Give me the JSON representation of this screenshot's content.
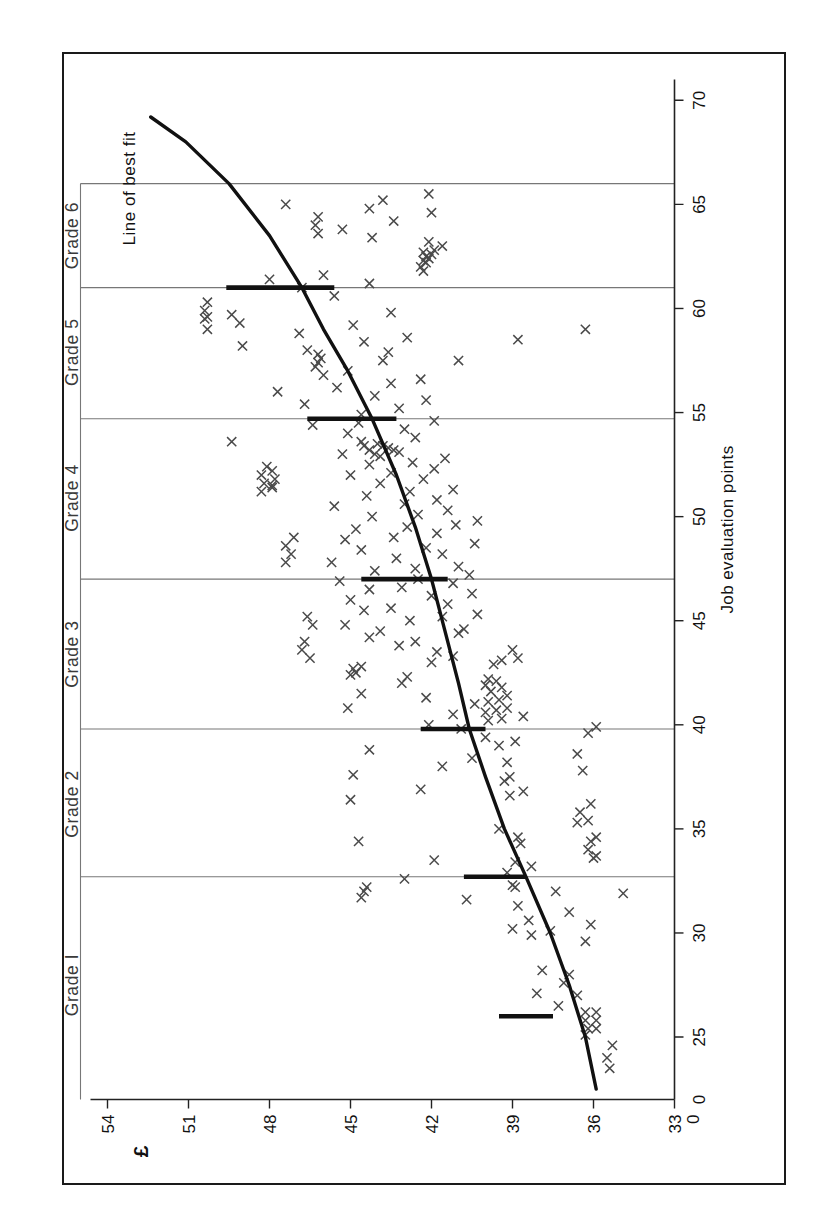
{
  "chart_data": {
    "type": "scatter",
    "title": "",
    "xlabel": "Job evaluation points",
    "ylabel": "£",
    "xlim": [
      22,
      71
    ],
    "ylim": [
      33,
      55
    ],
    "x_ticks": [
      0,
      25,
      30,
      35,
      40,
      45,
      50,
      55,
      60,
      65,
      70
    ],
    "x_tick_labels": [
      "0",
      "25",
      "30",
      "35",
      "40",
      "45",
      "50",
      "55",
      "60",
      "65",
      "70"
    ],
    "y_ticks": [
      33,
      36,
      39,
      42,
      45,
      48,
      51,
      54
    ],
    "y_tick_labels": [
      "33",
      "36",
      "39",
      "42",
      "45",
      "48",
      "51",
      "54"
    ],
    "y_axis_break_label": "0",
    "grid": false,
    "legend_position": "none",
    "annotations": [
      {
        "text": "Line of best fit",
        "x": 68.5,
        "y": 53.0
      }
    ],
    "grade_labels": [
      "Grade I",
      "Grade 2",
      "Grade 3",
      "Grade 4",
      "Grade 5",
      "Grade 6"
    ],
    "grade_boundaries": [
      32.7,
      39.8,
      47.0,
      54.7,
      61.0,
      66.0
    ],
    "grade_label_positions": [
      27.5,
      36.2,
      43.4,
      50.9,
      57.9,
      63.5
    ],
    "grade_rate_bars": [
      {
        "grade": "Grade I",
        "x": 26.0,
        "y_low": 37.5,
        "y_high": 39.5
      },
      {
        "grade": "Grade 2",
        "x": 32.7,
        "y_low": 38.5,
        "y_high": 40.8
      },
      {
        "grade": "Grade 3",
        "x": 39.8,
        "y_low": 40.0,
        "y_high": 42.4
      },
      {
        "grade": "Grade 4",
        "x": 47.0,
        "y_low": 41.4,
        "y_high": 44.6
      },
      {
        "grade": "Grade 5",
        "x": 54.7,
        "y_low": 43.3,
        "y_high": 46.6
      },
      {
        "grade": "Grade 6",
        "x": 61.0,
        "y_low": 45.6,
        "y_high": 49.6
      }
    ],
    "series": [
      {
        "name": "Line of best fit",
        "type": "line",
        "points": [
          [
            22.5,
            35.9
          ],
          [
            25.0,
            36.3
          ],
          [
            27.5,
            36.9
          ],
          [
            30.0,
            37.6
          ],
          [
            32.7,
            38.5
          ],
          [
            35.0,
            39.3
          ],
          [
            37.5,
            40.0
          ],
          [
            39.8,
            40.6
          ],
          [
            42.0,
            41.0
          ],
          [
            44.5,
            41.5
          ],
          [
            47.0,
            42.0
          ],
          [
            49.5,
            42.6
          ],
          [
            52.0,
            43.3
          ],
          [
            54.7,
            44.2
          ],
          [
            57.0,
            45.1
          ],
          [
            59.0,
            46.0
          ],
          [
            61.0,
            46.8
          ],
          [
            63.5,
            48.0
          ],
          [
            66.0,
            49.5
          ],
          [
            68.0,
            51.1
          ],
          [
            69.2,
            52.4
          ]
        ]
      },
      {
        "name": "Individual employee salaries",
        "type": "scatter",
        "marker": "x",
        "points": [
          [
            24.6,
            35.3
          ],
          [
            25.1,
            36.3
          ],
          [
            25.4,
            36.2
          ],
          [
            25.8,
            36.3
          ],
          [
            25.4,
            35.9
          ],
          [
            25.8,
            35.9
          ],
          [
            26.2,
            36.3
          ],
          [
            26.2,
            35.9
          ],
          [
            26.5,
            37.3
          ],
          [
            27.0,
            36.6
          ],
          [
            27.1,
            38.1
          ],
          [
            27.6,
            37.1
          ],
          [
            28.0,
            36.9
          ],
          [
            28.2,
            37.9
          ],
          [
            29.6,
            36.3
          ],
          [
            29.9,
            38.3
          ],
          [
            30.1,
            37.6
          ],
          [
            30.2,
            39.0
          ],
          [
            30.6,
            38.4
          ],
          [
            31.0,
            36.9
          ],
          [
            31.3,
            38.8
          ],
          [
            31.6,
            40.7
          ],
          [
            31.7,
            44.6
          ],
          [
            32.0,
            44.5
          ],
          [
            32.2,
            44.4
          ],
          [
            32.2,
            38.9
          ],
          [
            32.3,
            39.0
          ],
          [
            32.0,
            37.4
          ],
          [
            32.6,
            43.0
          ],
          [
            32.9,
            39.2
          ],
          [
            33.2,
            38.3
          ],
          [
            33.4,
            38.9
          ],
          [
            33.5,
            41.9
          ],
          [
            33.6,
            36.0
          ],
          [
            33.7,
            35.9
          ],
          [
            34.0,
            36.2
          ],
          [
            34.4,
            36.1
          ],
          [
            34.6,
            35.9
          ],
          [
            34.3,
            38.7
          ],
          [
            34.6,
            38.8
          ],
          [
            35.0,
            39.5
          ],
          [
            35.3,
            36.6
          ],
          [
            35.4,
            36.2
          ],
          [
            35.8,
            36.5
          ],
          [
            36.2,
            36.1
          ],
          [
            36.6,
            39.1
          ],
          [
            36.8,
            38.6
          ],
          [
            36.9,
            42.4
          ],
          [
            37.3,
            39.3
          ],
          [
            37.5,
            39.1
          ],
          [
            37.8,
            36.4
          ],
          [
            38.0,
            41.6
          ],
          [
            38.2,
            39.2
          ],
          [
            38.4,
            40.5
          ],
          [
            38.6,
            36.6
          ],
          [
            38.8,
            44.3
          ],
          [
            39.0,
            39.5
          ],
          [
            39.2,
            38.9
          ],
          [
            39.4,
            40.0
          ],
          [
            39.6,
            36.2
          ],
          [
            39.8,
            40.9
          ],
          [
            39.9,
            35.9
          ],
          [
            40.0,
            42.1
          ],
          [
            40.2,
            39.9
          ],
          [
            40.3,
            39.4
          ],
          [
            40.4,
            38.6
          ],
          [
            40.5,
            41.2
          ],
          [
            40.6,
            40.0
          ],
          [
            40.7,
            39.6
          ],
          [
            40.8,
            39.2
          ],
          [
            41.0,
            40.4
          ],
          [
            41.1,
            39.9
          ],
          [
            41.2,
            39.5
          ],
          [
            41.3,
            42.2
          ],
          [
            41.4,
            39.2
          ],
          [
            41.5,
            44.6
          ],
          [
            41.6,
            39.8
          ],
          [
            41.8,
            39.4
          ],
          [
            41.9,
            40.0
          ],
          [
            42.0,
            43.1
          ],
          [
            42.1,
            39.6
          ],
          [
            42.2,
            39.9
          ],
          [
            42.3,
            42.9
          ],
          [
            42.4,
            45.0
          ],
          [
            42.5,
            44.8
          ],
          [
            42.7,
            44.9
          ],
          [
            42.8,
            44.6
          ],
          [
            42.9,
            39.7
          ],
          [
            43.0,
            42.0
          ],
          [
            43.1,
            39.4
          ],
          [
            43.2,
            38.8
          ],
          [
            43.3,
            41.2
          ],
          [
            43.5,
            41.8
          ],
          [
            43.6,
            39.0
          ],
          [
            43.8,
            43.2
          ],
          [
            44.0,
            42.6
          ],
          [
            44.2,
            44.3
          ],
          [
            44.4,
            41.0
          ],
          [
            44.5,
            43.9
          ],
          [
            44.6,
            40.8
          ],
          [
            44.8,
            45.2
          ],
          [
            45.0,
            42.8
          ],
          [
            45.2,
            41.6
          ],
          [
            45.3,
            40.3
          ],
          [
            45.5,
            44.5
          ],
          [
            45.6,
            43.5
          ],
          [
            45.8,
            41.4
          ],
          [
            46.0,
            45.0
          ],
          [
            46.2,
            42.0
          ],
          [
            46.3,
            40.5
          ],
          [
            46.5,
            44.3
          ],
          [
            46.6,
            43.1
          ],
          [
            46.8,
            41.2
          ],
          [
            46.9,
            45.4
          ],
          [
            47.0,
            42.5
          ],
          [
            47.2,
            40.6
          ],
          [
            47.4,
            44.1
          ],
          [
            47.5,
            42.6
          ],
          [
            47.6,
            41.0
          ],
          [
            47.8,
            45.7
          ],
          [
            48.0,
            43.3
          ],
          [
            48.2,
            41.6
          ],
          [
            48.4,
            44.6
          ],
          [
            48.5,
            42.2
          ],
          [
            48.7,
            40.4
          ],
          [
            48.9,
            45.2
          ],
          [
            49.0,
            43.4
          ],
          [
            49.2,
            41.8
          ],
          [
            49.4,
            44.8
          ],
          [
            49.5,
            42.9
          ],
          [
            49.6,
            41.1
          ],
          [
            49.8,
            40.3
          ],
          [
            50.0,
            44.2
          ],
          [
            50.1,
            42.5
          ],
          [
            50.3,
            41.4
          ],
          [
            50.5,
            45.6
          ],
          [
            50.6,
            43.0
          ],
          [
            50.8,
            41.8
          ],
          [
            51.0,
            44.4
          ],
          [
            51.2,
            42.8
          ],
          [
            51.3,
            41.2
          ],
          [
            51.5,
            47.9
          ],
          [
            51.6,
            43.9
          ],
          [
            51.8,
            42.3
          ],
          [
            52.0,
            45.0
          ],
          [
            52.1,
            43.5
          ],
          [
            52.3,
            41.9
          ],
          [
            52.5,
            44.3
          ],
          [
            52.6,
            42.7
          ],
          [
            52.8,
            41.5
          ],
          [
            53.0,
            45.3
          ],
          [
            53.1,
            43.2
          ],
          [
            53.2,
            43.4
          ],
          [
            53.3,
            43.6
          ],
          [
            53.4,
            43.8
          ],
          [
            53.5,
            44.0
          ],
          [
            53.2,
            44.3
          ],
          [
            53.4,
            44.5
          ],
          [
            53.6,
            44.6
          ],
          [
            53.0,
            44.1
          ],
          [
            52.9,
            43.9
          ],
          [
            53.6,
            49.4
          ],
          [
            53.8,
            42.6
          ],
          [
            54.0,
            45.1
          ],
          [
            54.2,
            43.0
          ],
          [
            54.4,
            46.4
          ],
          [
            54.5,
            44.7
          ],
          [
            54.6,
            41.9
          ],
          [
            54.9,
            44.6
          ],
          [
            55.2,
            43.2
          ],
          [
            55.4,
            46.7
          ],
          [
            55.6,
            42.2
          ],
          [
            55.8,
            44.1
          ],
          [
            56.0,
            47.7
          ],
          [
            56.2,
            45.5
          ],
          [
            56.4,
            43.5
          ],
          [
            56.6,
            42.4
          ],
          [
            56.8,
            46.0
          ],
          [
            57.0,
            45.1
          ],
          [
            57.2,
            46.3
          ],
          [
            57.4,
            46.2
          ],
          [
            57.6,
            46.1
          ],
          [
            57.8,
            46.2
          ],
          [
            57.5,
            43.8
          ],
          [
            57.9,
            43.6
          ],
          [
            58.0,
            46.6
          ],
          [
            58.2,
            49.0
          ],
          [
            58.4,
            44.5
          ],
          [
            58.6,
            42.9
          ],
          [
            58.8,
            46.9
          ],
          [
            59.0,
            50.3
          ],
          [
            59.2,
            44.9
          ],
          [
            59.3,
            49.1
          ],
          [
            59.5,
            50.4
          ],
          [
            59.6,
            50.3
          ],
          [
            59.7,
            49.4
          ],
          [
            59.8,
            43.5
          ],
          [
            59.9,
            50.4
          ],
          [
            59.0,
            36.3
          ],
          [
            58.5,
            38.8
          ],
          [
            57.5,
            41.0
          ],
          [
            60.3,
            50.3
          ],
          [
            60.6,
            45.6
          ],
          [
            61.0,
            46.8
          ],
          [
            61.2,
            44.3
          ],
          [
            61.4,
            48.0
          ],
          [
            61.6,
            46.0
          ],
          [
            61.8,
            42.3
          ],
          [
            62.0,
            42.4
          ],
          [
            62.2,
            42.2
          ],
          [
            62.3,
            42.3
          ],
          [
            62.4,
            42.1
          ],
          [
            62.5,
            42.2
          ],
          [
            62.6,
            42.0
          ],
          [
            62.7,
            42.3
          ],
          [
            62.8,
            41.9
          ],
          [
            63.0,
            41.6
          ],
          [
            63.2,
            42.1
          ],
          [
            63.4,
            44.2
          ],
          [
            63.6,
            46.2
          ],
          [
            63.8,
            45.3
          ],
          [
            64.0,
            46.3
          ],
          [
            64.2,
            43.4
          ],
          [
            64.4,
            46.2
          ],
          [
            64.6,
            42.0
          ],
          [
            64.8,
            44.3
          ],
          [
            65.0,
            47.4
          ],
          [
            65.2,
            43.8
          ],
          [
            65.5,
            42.1
          ],
          [
            44.0,
            46.7
          ],
          [
            43.6,
            46.8
          ],
          [
            43.2,
            46.5
          ],
          [
            45.2,
            46.6
          ],
          [
            44.8,
            46.4
          ],
          [
            47.8,
            47.4
          ],
          [
            48.2,
            47.2
          ],
          [
            48.6,
            47.4
          ],
          [
            49.0,
            47.1
          ],
          [
            51.2,
            48.3
          ],
          [
            51.6,
            48.2
          ],
          [
            52.0,
            48.3
          ],
          [
            52.4,
            48.1
          ],
          [
            51.4,
            47.9
          ],
          [
            51.8,
            47.8
          ],
          [
            52.2,
            47.9
          ],
          [
            34.4,
            44.7
          ],
          [
            36.4,
            45.0
          ],
          [
            37.6,
            44.9
          ],
          [
            40.8,
            45.1
          ],
          [
            23.5,
            35.4
          ],
          [
            24.0,
            35.5
          ],
          [
            30.4,
            36.1
          ],
          [
            31.9,
            34.9
          ]
        ]
      }
    ]
  },
  "figure": {
    "outer_border": true,
    "background_color": "#ffffff",
    "ink_color": "#111111",
    "band_line_color": "#777777"
  }
}
